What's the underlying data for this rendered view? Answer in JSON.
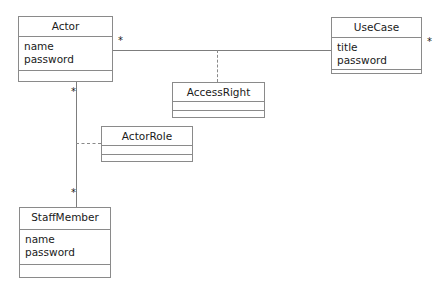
{
  "diagram": {
    "type": "uml-class-diagram",
    "classes": [
      {
        "id": "actor",
        "name": "Actor",
        "attributes": [
          "name",
          "password"
        ],
        "operations": [],
        "x": 18,
        "y": 16,
        "width": 95,
        "height": 66,
        "name_h": 20,
        "attrs_h": 34
      },
      {
        "id": "usecase",
        "name": "UseCase",
        "attributes": [
          "title",
          "password"
        ],
        "operations": [],
        "x": 331,
        "y": 17,
        "width": 91,
        "height": 57,
        "name_h": 20,
        "attrs_h": 32
      },
      {
        "id": "accessright",
        "name": "AccessRight",
        "attributes": [],
        "operations": [],
        "x": 172,
        "y": 82,
        "width": 93,
        "height": 36,
        "name_h": 19,
        "attrs_h": 9
      },
      {
        "id": "actorrole",
        "name": "ActorRole",
        "attributes": [],
        "operations": [],
        "x": 101,
        "y": 126,
        "width": 92,
        "height": 36,
        "name_h": 19,
        "attrs_h": 9
      },
      {
        "id": "staffmember",
        "name": "StaffMember",
        "attributes": [
          "name",
          "password"
        ],
        "operations": [],
        "x": 19,
        "y": 207,
        "width": 92,
        "height": 71,
        "name_h": 22,
        "attrs_h": 35
      }
    ],
    "multiplicities": [
      {
        "id": "actor-to-usecase",
        "label": "*",
        "x": 118,
        "y": 36
      },
      {
        "id": "usecase-end",
        "label": "*",
        "x": 427,
        "y": 37
      },
      {
        "id": "actor-to-staffmember-top",
        "label": "*",
        "x": 71,
        "y": 87
      },
      {
        "id": "actor-to-staffmember-bottom",
        "label": "*",
        "x": 71,
        "y": 188
      }
    ],
    "associations": [
      {
        "id": "actor-usecase-association",
        "from": "actor",
        "to": "usecase",
        "style": "solid",
        "orientation": "horizontal",
        "x": 113,
        "y": 50,
        "length": 218
      },
      {
        "id": "actor-staffmember-association",
        "from": "actor",
        "to": "staffmember",
        "style": "solid",
        "orientation": "vertical",
        "x": 76,
        "y": 82,
        "length": 125
      }
    ],
    "association_links": [
      {
        "id": "accessright-link",
        "association": "actor-usecase-association",
        "to": "accessright",
        "style": "dashed",
        "orientation": "vertical",
        "x": 217,
        "y": 50,
        "length": 32
      },
      {
        "id": "actorrole-link",
        "association": "actor-staffmember-association",
        "to": "actorrole",
        "style": "dashed",
        "orientation": "horizontal",
        "x": 76,
        "y": 143,
        "length": 25
      }
    ]
  },
  "colors": {
    "border": "#8a8a8a",
    "line": "#7d7d7d",
    "text": "#1a1a1a",
    "background": "#ffffff"
  }
}
